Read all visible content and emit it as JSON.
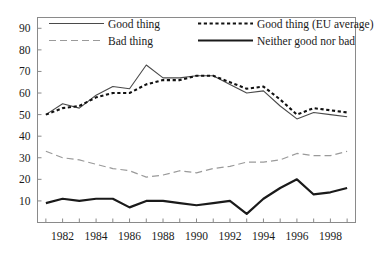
{
  "chart_data": {
    "type": "line",
    "title": "",
    "subtitle": "",
    "xlabel": "",
    "ylabel": "",
    "xlim": [
      1980.5,
      1999.5
    ],
    "ylim": [
      0,
      95
    ],
    "yticks": [
      10,
      20,
      30,
      40,
      50,
      60,
      70,
      80,
      90
    ],
    "ytick_labels": [
      "10",
      "20",
      "30",
      "40",
      "50",
      "60",
      "70",
      "80",
      "90"
    ],
    "xticks": [
      1981,
      1982,
      1983,
      1984,
      1985,
      1986,
      1987,
      1988,
      1989,
      1990,
      1991,
      1992,
      1993,
      1994,
      1995,
      1996,
      1997,
      1998,
      1999
    ],
    "xtick_labels_shown": [
      "1982",
      "1984",
      "1986",
      "1988",
      "1990",
      "1992",
      "1994",
      "1996",
      "1998"
    ],
    "xtick_label_years": [
      1982,
      1984,
      1986,
      1988,
      1990,
      1992,
      1994,
      1996,
      1998
    ],
    "grid": false,
    "legend_position": "top-inside",
    "x": [
      1981,
      1982,
      1983,
      1984,
      1985,
      1986,
      1987,
      1988,
      1989,
      1990,
      1991,
      1992,
      1993,
      1994,
      1995,
      1996,
      1997,
      1998,
      1999
    ],
    "series": [
      {
        "name": "Good thing",
        "style": "thin-solid",
        "color": "#4a4a4a",
        "values": [
          50,
          55,
          53,
          59,
          63,
          62,
          73,
          67,
          67,
          68,
          68,
          64,
          60,
          61,
          54,
          48,
          51,
          50,
          49
        ]
      },
      {
        "name": "Bad thing",
        "style": "dashed",
        "color": "#9a9a9a",
        "values": [
          33,
          30,
          29,
          27,
          25,
          24,
          21,
          22,
          24,
          23,
          25,
          26,
          28,
          28,
          29,
          32,
          31,
          31,
          33
        ]
      },
      {
        "name": "Good thing (EU average)",
        "style": "dotted-bold",
        "color": "#111111",
        "values": [
          50,
          53,
          54,
          58,
          60,
          60,
          64,
          66,
          66,
          68,
          68,
          65,
          62,
          63,
          57,
          50,
          53,
          52,
          51
        ]
      },
      {
        "name": "Neither good nor bad",
        "style": "thick-solid",
        "color": "#1a1a1a",
        "values": [
          9,
          11,
          10,
          11,
          11,
          7,
          10,
          10,
          9,
          8,
          9,
          10,
          4,
          11,
          16,
          20,
          13,
          14,
          16
        ]
      }
    ],
    "legend": [
      {
        "label": "Good thing",
        "style": "thin-solid"
      },
      {
        "label": "Good thing (EU average)",
        "style": "dotted-bold"
      },
      {
        "label": "Bad thing",
        "style": "dashed"
      },
      {
        "label": "Neither good nor bad",
        "style": "thick-solid"
      }
    ]
  }
}
